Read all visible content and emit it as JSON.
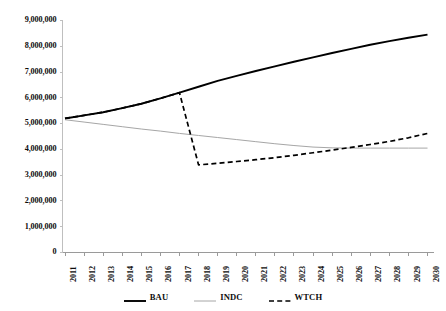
{
  "chart_data": {
    "type": "line",
    "title": "",
    "subtitle": "",
    "xlabel": "",
    "ylabel": "",
    "grid": false,
    "legend_position": "bottom",
    "x": [
      2011,
      2012,
      2013,
      2014,
      2015,
      2016,
      2017,
      2018,
      2019,
      2020,
      2021,
      2022,
      2023,
      2024,
      2025,
      2026,
      2027,
      2028,
      2029,
      2030
    ],
    "categories": [
      "2011",
      "2012",
      "2013",
      "2014",
      "2015",
      "2016",
      "2017",
      "2018",
      "2019",
      "2020",
      "2021",
      "2022",
      "2023",
      "2024",
      "2025",
      "2026",
      "2027",
      "2028",
      "2029",
      "2030"
    ],
    "xlim": [
      2011,
      2030
    ],
    "ylim": [
      0,
      9000000
    ],
    "ytick_values": [
      0,
      1000000,
      2000000,
      3000000,
      4000000,
      5000000,
      6000000,
      7000000,
      8000000,
      9000000
    ],
    "ytick_labels": [
      "0",
      "1,000,000",
      "2,000,000",
      "3,000,000",
      "4,000,000",
      "5,000,000",
      "6,000,000",
      "7,000,000",
      "8,000,000",
      "9,000,000"
    ],
    "series": [
      {
        "name": "BAU",
        "style": "solid",
        "color": "#000000",
        "width": 1.9,
        "values": [
          5200000,
          5320000,
          5440000,
          5600000,
          5770000,
          5980000,
          6200000,
          6430000,
          6660000,
          6850000,
          7040000,
          7220000,
          7400000,
          7570000,
          7740000,
          7900000,
          8060000,
          8200000,
          8330000,
          8450000
        ]
      },
      {
        "name": "INDC",
        "style": "solid",
        "color": "#a6a6a6",
        "width": 1.0,
        "values": [
          5150000,
          5060000,
          4970000,
          4880000,
          4790000,
          4710000,
          4620000,
          4540000,
          4460000,
          4380000,
          4300000,
          4220000,
          4150000,
          4090000,
          4060000,
          4050000,
          4050000,
          4050000,
          4050000,
          4050000
        ]
      },
      {
        "name": "WTCH",
        "style": "dashed",
        "color": "#000000",
        "width": 1.7,
        "values": [
          5200000,
          5320000,
          5440000,
          5600000,
          5770000,
          5980000,
          6200000,
          3400000,
          3460000,
          3530000,
          3600000,
          3680000,
          3770000,
          3870000,
          3970000,
          4080000,
          4190000,
          4310000,
          4450000,
          4620000
        ]
      }
    ]
  },
  "legend": {
    "items": [
      {
        "label": "BAU",
        "swatch": "solid-thick-black"
      },
      {
        "label": "INDC",
        "swatch": "solid-thin-gray"
      },
      {
        "label": "WTCH",
        "swatch": "dashed-black"
      }
    ]
  },
  "axes": {
    "y_axis_name": "value-axis",
    "x_axis_name": "year-axis"
  }
}
